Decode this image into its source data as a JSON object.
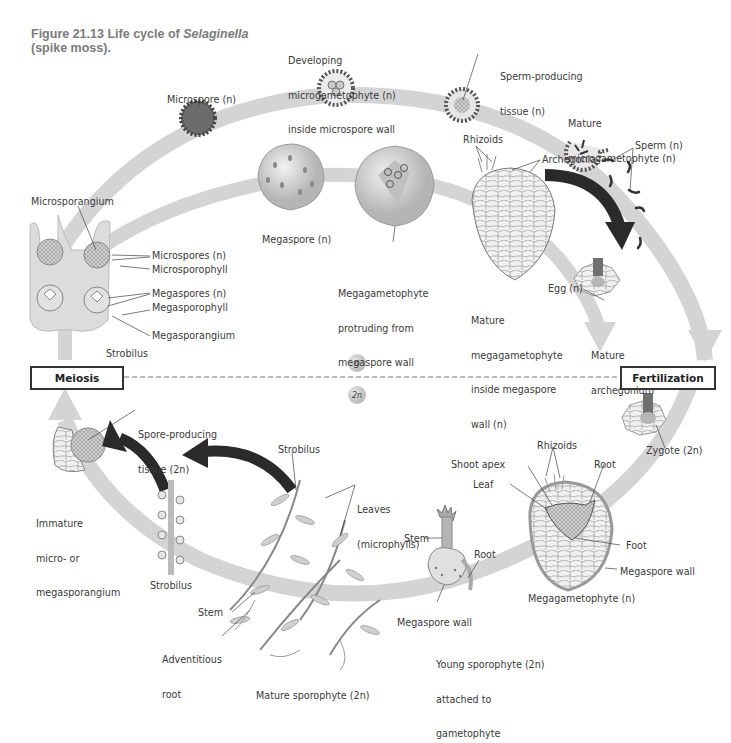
{
  "figure": {
    "number": "Figure 21.13",
    "title_prefix": "Life cycle of ",
    "title_genus": "Selaginella",
    "title_suffix": "(spike moss)."
  },
  "phases": {
    "meiosis": "Meiosis",
    "fertilization": "Fertilization",
    "haploid": "n",
    "diploid": "2n"
  },
  "colors": {
    "arc": "#d4d4d4",
    "dark_arrow": "#2a2a2a",
    "text": "#3a3a3a",
    "title": "#7a7a7a"
  },
  "labels": {
    "microspore": "Microspore (n)",
    "developing_microgametophyte": [
      "Developing",
      "microgametophyte (n)",
      "inside microspore wall"
    ],
    "sperm_producing_tissue": [
      "Sperm-producing",
      "tissue (n)"
    ],
    "mature_microgametophyte": [
      "Mature",
      "microgametophyte (n)"
    ],
    "sperm": "Sperm (n)",
    "microsporangium": "Microsporangium",
    "microspores": "Microspores (n)",
    "microsporophyll": "Microsporophyll",
    "megaspores": "Megaspores (n)",
    "megasporophyll": "Megasporophyll",
    "megasporangium": "Megasporangium",
    "strobilus_top": "Strobilus",
    "megaspore": "Megaspore (n)",
    "megagametophyte_protruding": [
      "Megagametophyte",
      "protruding from",
      "megaspore wall"
    ],
    "rhizoids_top": "Rhizoids",
    "archegonia": "Archegonia",
    "mature_megagametophyte": [
      "Mature",
      "megagametophyte",
      "inside megaspore",
      "wall (n)"
    ],
    "egg": "Egg (n)",
    "mature_archegonium": [
      "Mature",
      "archegonium"
    ],
    "spore_producing_tissue": [
      "Spore-producing",
      "tissue (2n)"
    ],
    "immature_sporangium": [
      "Immature",
      "micro- or",
      "megasporangium"
    ],
    "strobilus_left": "Strobilus",
    "strobilus_plant": "Strobilus",
    "leaves": [
      "Leaves",
      "(microphylls)"
    ],
    "stem_plant": "Stem",
    "adventitious_root": [
      "Adventitious",
      "root"
    ],
    "mature_sporophyte": "Mature sporophyte (2n)",
    "stem_young": "Stem",
    "root_young": "Root",
    "megaspore_wall_young": "Megaspore wall",
    "young_sporophyte": [
      "Young sporophyte (2n)",
      "attached to",
      "gametophyte"
    ],
    "rhizoids_bottom": "Rhizoids",
    "shoot_apex": "Shoot apex",
    "root_embryo": "Root",
    "leaf": "Leaf",
    "foot": "Foot",
    "megaspore_wall_embryo": "Megaspore wall",
    "megagametophyte": "Megagametophyte (n)",
    "zygote": "Zygote (2n)"
  }
}
